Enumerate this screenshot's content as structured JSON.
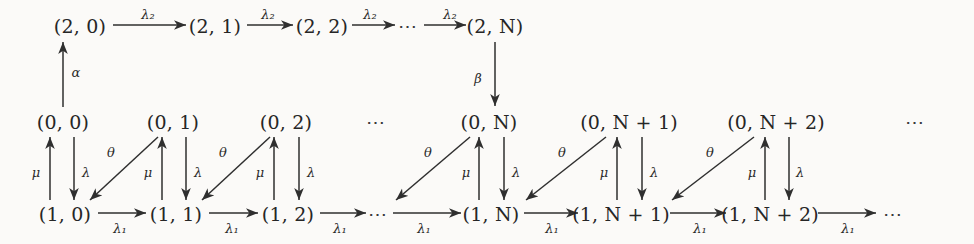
{
  "diagram": {
    "background": "#fbfaf8",
    "stroke_color": "#2f2f2f",
    "text_color": "#262626",
    "ellipsis": "⋯",
    "rows": {
      "top": {
        "name": "row-2",
        "nodes": [
          {
            "id": "n2-0",
            "label": "(2, 0)",
            "x": 80,
            "y": 26
          },
          {
            "id": "n2-1",
            "label": "(2, 1)",
            "x": 215,
            "y": 26
          },
          {
            "id": "n2-2",
            "label": "(2, 2)",
            "x": 322,
            "y": 26
          },
          {
            "id": "n2-N",
            "label": "(2, N)",
            "x": 495,
            "y": 26
          }
        ],
        "gaps": [
          {
            "id": "top-dots",
            "label": "⋯",
            "x": 408,
            "y": 26
          }
        ]
      },
      "middle": {
        "name": "row-0",
        "nodes": [
          {
            "id": "n0-0",
            "label": "(0, 0)",
            "x": 63,
            "y": 122
          },
          {
            "id": "n0-1",
            "label": "(0, 1)",
            "x": 173,
            "y": 122
          },
          {
            "id": "n0-2",
            "label": "(0, 2)",
            "x": 286,
            "y": 122
          },
          {
            "id": "n0-N",
            "label": "(0, N)",
            "x": 489,
            "y": 122
          },
          {
            "id": "n0-N1",
            "label": "(0, N + 1)",
            "x": 629,
            "y": 122
          },
          {
            "id": "n0-N2",
            "label": "(0, N + 2)",
            "x": 776,
            "y": 122
          }
        ],
        "gaps": [
          {
            "id": "mid-dots-left",
            "label": "⋯",
            "x": 376,
            "y": 122
          },
          {
            "id": "mid-dots-right",
            "label": "⋯",
            "x": 915,
            "y": 122
          }
        ]
      },
      "bottom": {
        "name": "row-1",
        "nodes": [
          {
            "id": "n1-0",
            "label": "(1, 0)",
            "x": 65,
            "y": 214
          },
          {
            "id": "n1-1",
            "label": "(1, 1)",
            "x": 176,
            "y": 214
          },
          {
            "id": "n1-2",
            "label": "(1, 2)",
            "x": 288,
            "y": 214
          },
          {
            "id": "n1-N",
            "label": "(1, N)",
            "x": 491,
            "y": 214
          },
          {
            "id": "n1-N1",
            "label": "(1, N + 1)",
            "x": 621,
            "y": 214
          },
          {
            "id": "n1-N2",
            "label": "(1, N + 2)",
            "x": 770,
            "y": 214
          }
        ],
        "gaps": [
          {
            "id": "bot-dots-left",
            "label": "⋯",
            "x": 378,
            "y": 214
          },
          {
            "id": "bot-dots-right",
            "label": "⋯",
            "x": 893,
            "y": 214
          }
        ]
      }
    },
    "rate_labels": {
      "lambda2": "λ₂",
      "lambda1": "λ₁",
      "lambda": "λ",
      "mu": "μ",
      "theta": "θ",
      "alpha": "α",
      "beta": "β"
    },
    "edge_labels": [
      {
        "id": "e-top-1",
        "text": "λ₂",
        "x": 148,
        "y": 14
      },
      {
        "id": "e-top-2",
        "text": "λ₂",
        "x": 268,
        "y": 14
      },
      {
        "id": "e-top-3",
        "text": "λ₂",
        "x": 370,
        "y": 14
      },
      {
        "id": "e-top-4",
        "text": "λ₂",
        "x": 450,
        "y": 14
      },
      {
        "id": "e-alpha",
        "text": "α",
        "x": 76,
        "y": 72
      },
      {
        "id": "e-beta",
        "text": "β",
        "x": 478,
        "y": 78
      },
      {
        "id": "e-mu-0",
        "text": "μ",
        "x": 36,
        "y": 172
      },
      {
        "id": "e-lam-0",
        "text": "λ",
        "x": 86,
        "y": 172
      },
      {
        "id": "e-the-0",
        "text": "θ",
        "x": 111,
        "y": 152
      },
      {
        "id": "e-mu-1",
        "text": "μ",
        "x": 148,
        "y": 172
      },
      {
        "id": "e-lam-1",
        "text": "λ",
        "x": 198,
        "y": 172
      },
      {
        "id": "e-the-1",
        "text": "θ",
        "x": 223,
        "y": 152
      },
      {
        "id": "e-mu-2",
        "text": "μ",
        "x": 260,
        "y": 172
      },
      {
        "id": "e-lam-2",
        "text": "λ",
        "x": 311,
        "y": 172
      },
      {
        "id": "e-the-N",
        "text": "θ",
        "x": 428,
        "y": 152
      },
      {
        "id": "e-mu-N",
        "text": "μ",
        "x": 466,
        "y": 172
      },
      {
        "id": "e-lam-N",
        "text": "λ",
        "x": 516,
        "y": 172
      },
      {
        "id": "e-the-N1",
        "text": "θ",
        "x": 562,
        "y": 152
      },
      {
        "id": "e-mu-N1",
        "text": "μ",
        "x": 604,
        "y": 172
      },
      {
        "id": "e-lam-N1",
        "text": "λ",
        "x": 654,
        "y": 172
      },
      {
        "id": "e-the-N2",
        "text": "θ",
        "x": 710,
        "y": 152
      },
      {
        "id": "e-mu-N2",
        "text": "μ",
        "x": 752,
        "y": 172
      },
      {
        "id": "e-lam-N2",
        "text": "λ",
        "x": 800,
        "y": 172
      },
      {
        "id": "e-bot-1",
        "text": "λ₁",
        "x": 120,
        "y": 228
      },
      {
        "id": "e-bot-2",
        "text": "λ₁",
        "x": 232,
        "y": 228
      },
      {
        "id": "e-bot-3",
        "text": "λ₁",
        "x": 340,
        "y": 228
      },
      {
        "id": "e-bot-4",
        "text": "λ₁",
        "x": 424,
        "y": 228
      },
      {
        "id": "e-bot-5",
        "text": "λ₁",
        "x": 552,
        "y": 228
      },
      {
        "id": "e-bot-6",
        "text": "λ₁",
        "x": 700,
        "y": 228
      },
      {
        "id": "e-bot-7",
        "text": "λ₁",
        "x": 848,
        "y": 228
      }
    ],
    "edges": [
      {
        "id": "a-top-1",
        "from": "n2-0",
        "to": "n2-1",
        "rate": "λ₂",
        "x1": 113,
        "y1": 25,
        "x2": 186,
        "y2": 25
      },
      {
        "id": "a-top-2",
        "from": "n2-1",
        "to": "n2-2",
        "rate": "λ₂",
        "x1": 247,
        "y1": 25,
        "x2": 293,
        "y2": 25
      },
      {
        "id": "a-top-3",
        "from": "n2-2",
        "to": "top-dots",
        "rate": "λ₂",
        "x1": 352,
        "y1": 25,
        "x2": 395,
        "y2": 25
      },
      {
        "id": "a-top-4",
        "from": "top-dots",
        "to": "n2-N",
        "rate": "λ₂",
        "x1": 424,
        "y1": 25,
        "x2": 466,
        "y2": 25
      },
      {
        "id": "a-alpha",
        "from": "n0-0",
        "to": "n2-0",
        "rate": "α",
        "x1": 63,
        "y1": 107,
        "x2": 63,
        "y2": 42
      },
      {
        "id": "a-beta",
        "from": "n2-N",
        "to": "n0-N",
        "rate": "β",
        "x1": 495,
        "y1": 42,
        "x2": 495,
        "y2": 106
      },
      {
        "id": "a-mu-0",
        "from": "n1-0",
        "to": "n0-0",
        "rate": "μ",
        "x1": 50,
        "y1": 200,
        "x2": 50,
        "y2": 137
      },
      {
        "id": "a-lam-0",
        "from": "n0-0",
        "to": "n1-0",
        "rate": "λ",
        "x1": 74,
        "y1": 137,
        "x2": 74,
        "y2": 200
      },
      {
        "id": "a-the-0",
        "from": "n0-1",
        "to": "n1-0",
        "rate": "θ",
        "x1": 158,
        "y1": 137,
        "x2": 90,
        "y2": 200
      },
      {
        "id": "a-mu-1",
        "from": "n1-1",
        "to": "n0-1",
        "rate": "μ",
        "x1": 162,
        "y1": 200,
        "x2": 162,
        "y2": 137
      },
      {
        "id": "a-lam-1",
        "from": "n0-1",
        "to": "n1-1",
        "rate": "λ",
        "x1": 186,
        "y1": 137,
        "x2": 186,
        "y2": 200
      },
      {
        "id": "a-the-1",
        "from": "n0-2",
        "to": "n1-1",
        "rate": "θ",
        "x1": 270,
        "y1": 137,
        "x2": 202,
        "y2": 200
      },
      {
        "id": "a-mu-2",
        "from": "n1-2",
        "to": "n0-2",
        "rate": "μ",
        "x1": 274,
        "y1": 200,
        "x2": 274,
        "y2": 137
      },
      {
        "id": "a-lam-2",
        "from": "n0-2",
        "to": "n1-2",
        "rate": "λ",
        "x1": 299,
        "y1": 137,
        "x2": 299,
        "y2": 200
      },
      {
        "id": "a-the-N",
        "from": "n0-N",
        "to": "bot-dots-left",
        "rate": "θ",
        "x1": 470,
        "y1": 137,
        "x2": 396,
        "y2": 200
      },
      {
        "id": "a-mu-N",
        "from": "n1-N",
        "to": "n0-N",
        "rate": "μ",
        "x1": 479,
        "y1": 200,
        "x2": 479,
        "y2": 137
      },
      {
        "id": "a-lam-N",
        "from": "n0-N",
        "to": "n1-N",
        "rate": "λ",
        "x1": 504,
        "y1": 137,
        "x2": 504,
        "y2": 200
      },
      {
        "id": "a-the-N1",
        "from": "n0-N1",
        "to": "n1-N",
        "rate": "θ",
        "x1": 606,
        "y1": 137,
        "x2": 526,
        "y2": 200
      },
      {
        "id": "a-mu-N1",
        "from": "n1-N1",
        "to": "n0-N1",
        "rate": "μ",
        "x1": 617,
        "y1": 200,
        "x2": 617,
        "y2": 137
      },
      {
        "id": "a-lam-N1",
        "from": "n0-N1",
        "to": "n1-N1",
        "rate": "λ",
        "x1": 642,
        "y1": 137,
        "x2": 642,
        "y2": 200
      },
      {
        "id": "a-the-N2",
        "from": "n0-N2",
        "to": "n1-N1",
        "rate": "θ",
        "x1": 754,
        "y1": 137,
        "x2": 672,
        "y2": 200
      },
      {
        "id": "a-mu-N2",
        "from": "n1-N2",
        "to": "n0-N2",
        "rate": "μ",
        "x1": 765,
        "y1": 200,
        "x2": 765,
        "y2": 137
      },
      {
        "id": "a-lam-N2",
        "from": "n0-N2",
        "to": "n1-N2",
        "rate": "λ",
        "x1": 789,
        "y1": 137,
        "x2": 789,
        "y2": 200
      },
      {
        "id": "a-bot-1",
        "from": "n1-0",
        "to": "n1-1",
        "rate": "λ₁",
        "x1": 98,
        "y1": 213,
        "x2": 146,
        "y2": 213
      },
      {
        "id": "a-bot-2",
        "from": "n1-1",
        "to": "n1-2",
        "rate": "λ₁",
        "x1": 209,
        "y1": 213,
        "x2": 258,
        "y2": 213
      },
      {
        "id": "a-bot-3",
        "from": "n1-2",
        "to": "bot-dots-left",
        "rate": "λ₁",
        "x1": 320,
        "y1": 213,
        "x2": 366,
        "y2": 213
      },
      {
        "id": "a-bot-4",
        "from": "bot-dots-left",
        "to": "n1-N",
        "rate": "λ₁",
        "x1": 393,
        "y1": 213,
        "x2": 461,
        "y2": 213
      },
      {
        "id": "a-bot-5",
        "from": "n1-N",
        "to": "n1-N1",
        "rate": "λ₁",
        "x1": 524,
        "y1": 213,
        "x2": 578,
        "y2": 213
      },
      {
        "id": "a-bot-6",
        "from": "n1-N1",
        "to": "n1-N2",
        "rate": "λ₁",
        "x1": 670,
        "y1": 213,
        "x2": 726,
        "y2": 213
      },
      {
        "id": "a-bot-7",
        "from": "n1-N2",
        "to": "bot-dots-right",
        "rate": "λ₁",
        "x1": 818,
        "y1": 213,
        "x2": 876,
        "y2": 213
      }
    ]
  }
}
